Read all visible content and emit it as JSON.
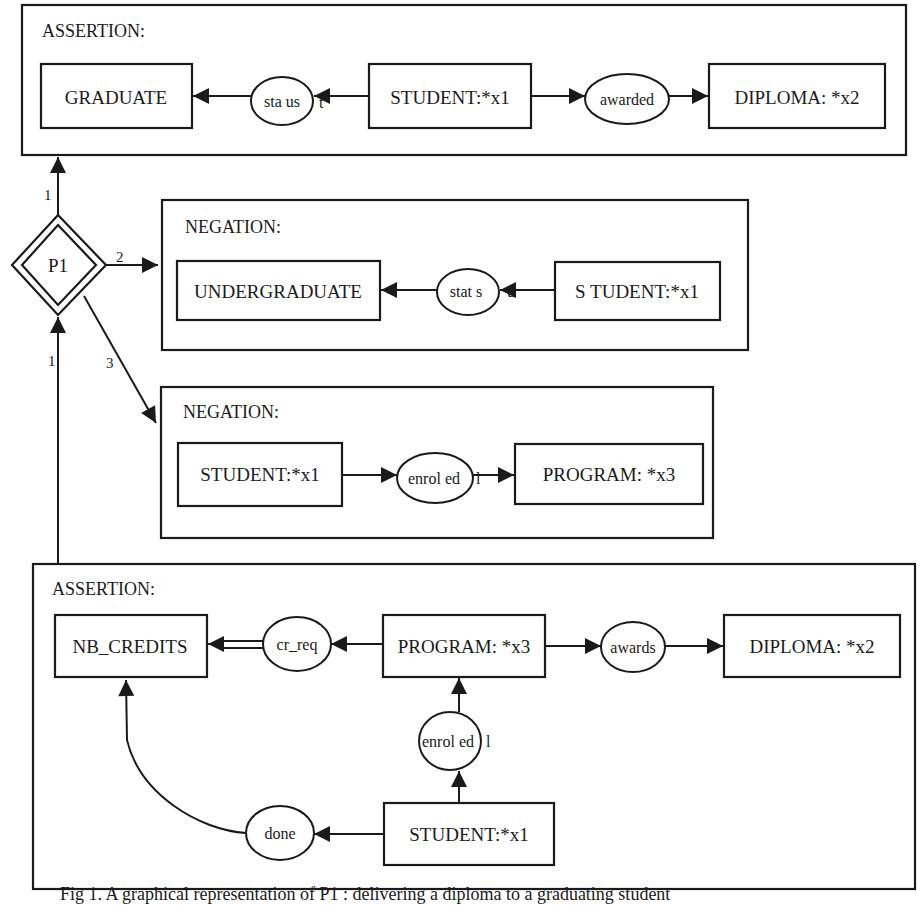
{
  "figure": {
    "caption": "Fig 1. A graphical representation of P1 : delivering a diploma to a graduating student"
  },
  "proposition": {
    "label": "P1"
  },
  "links": {
    "to_top": "1",
    "from_bottom": "1",
    "to_negation1": "2",
    "to_negation2": "3"
  },
  "contexts": [
    {
      "title": "ASSERTION:",
      "concepts": [
        "GRADUATE",
        "STUDENT:*x1",
        "DIPLOMA: *x2"
      ],
      "relations": [
        "sta us",
        "awarded"
      ],
      "marks": [
        "t"
      ]
    },
    {
      "title": "NEGATION:",
      "concepts": [
        "UNDERGRADUATE",
        "S TUDENT:*x1"
      ],
      "relations": [
        "stat s"
      ],
      "marks": [
        "u"
      ]
    },
    {
      "title": "NEGATION:",
      "concepts": [
        "STUDENT:*x1",
        "PROGRAM: *x3"
      ],
      "relations": [
        "enrol ed"
      ],
      "marks": [
        "l"
      ]
    },
    {
      "title": "ASSERTION:",
      "concepts": [
        "NB_CREDITS",
        "PROGRAM: *x3",
        "DIPLOMA: *x2",
        "STUDENT:*x1"
      ],
      "relations": [
        "cr_req",
        "awards",
        "enrol ed",
        "done"
      ],
      "marks": [
        "l"
      ]
    }
  ]
}
